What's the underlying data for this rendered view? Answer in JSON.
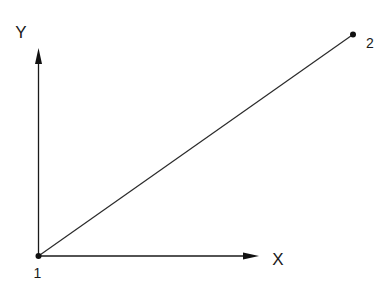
{
  "diagram": {
    "type": "vector-coordinate-diagram",
    "axes": {
      "y": {
        "label": "Y"
      },
      "x": {
        "label": "X"
      }
    },
    "points": [
      {
        "id": "point-1",
        "label": "1"
      },
      {
        "id": "point-2",
        "label": "2"
      }
    ],
    "colors": {
      "stroke": "#1a1a1a",
      "background": "#ffffff"
    }
  }
}
